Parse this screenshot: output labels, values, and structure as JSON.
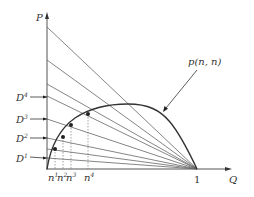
{
  "diagram": {
    "axes": {
      "y_label": "P",
      "x_label": "Q",
      "x_tick_label": "1"
    },
    "curve_label": "p(n, n)",
    "demand_labels": [
      {
        "base": "D",
        "sup": "4"
      },
      {
        "base": "D",
        "sup": "3"
      },
      {
        "base": "D",
        "sup": "2"
      },
      {
        "base": "D",
        "sup": "1"
      }
    ],
    "n_labels": [
      {
        "base": "n",
        "sup": "1"
      },
      {
        "base": "n",
        "sup": "2"
      },
      {
        "base": "n",
        "sup": "3"
      },
      {
        "base": "n",
        "sup": "4"
      }
    ],
    "colors": {
      "line": "#555555",
      "curve": "#333333",
      "text": "#333333"
    }
  }
}
